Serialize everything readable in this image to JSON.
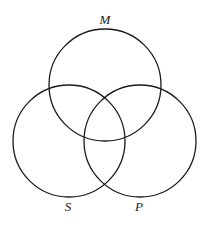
{
  "diagram": {
    "type": "venn",
    "sets": [
      {
        "id": "M",
        "label": "M",
        "cx": 105,
        "cy": 85,
        "r": 56,
        "label_x": 105,
        "label_y": 24
      },
      {
        "id": "S",
        "label": "S",
        "cx": 69,
        "cy": 141,
        "r": 56,
        "label_x": 68,
        "label_y": 211
      },
      {
        "id": "P",
        "label": "P",
        "cx": 140,
        "cy": 141,
        "r": 56,
        "label_x": 139,
        "label_y": 211
      }
    ],
    "stroke_color": "#1a1a1a",
    "background": "#ffffff"
  }
}
